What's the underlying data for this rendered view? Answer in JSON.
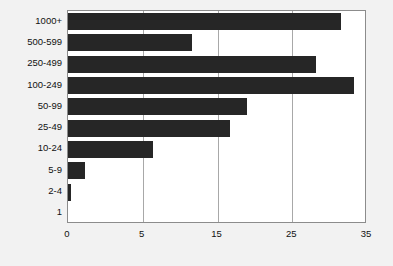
{
  "chart_data": {
    "type": "bar",
    "orientation": "horizontal",
    "title": "",
    "subtitle": "",
    "xlabel": "",
    "ylabel": "",
    "categories": [
      "1000+",
      "500-599",
      "250-499",
      "100-249",
      "50-99",
      "25-49",
      "10-24",
      "5-9",
      "2-4",
      "1"
    ],
    "values": [
      32,
      14.5,
      29,
      33.5,
      21,
      19,
      10,
      2,
      0.4,
      0
    ],
    "series": [
      {
        "name": "",
        "values": [
          32,
          14.5,
          29,
          33.5,
          21,
          19,
          10,
          2,
          0.4,
          0
        ]
      }
    ],
    "xticks": [
      "0",
      "5",
      "15",
      "25",
      "35"
    ],
    "xtick_values": [
      0,
      5,
      15,
      25,
      35
    ],
    "xlim": [
      0,
      35
    ],
    "ylim": null,
    "grid": "vertical",
    "legend": "none",
    "bar_color": "#262626",
    "plot_background": "#ffffff",
    "page_background": "#f2f2f2",
    "frame_color": "#8c8c8c",
    "gridline_color": "#a8a8a8",
    "annotations": []
  },
  "axes": {
    "x_tick_labels": [
      {
        "text": "0",
        "pos_pct": 0
      },
      {
        "text": "5",
        "pos_pct": 25
      },
      {
        "text": "15",
        "pos_pct": 50
      },
      {
        "text": "25",
        "pos_pct": 75
      },
      {
        "text": "35",
        "pos_pct": 100
      }
    ],
    "y_tick_labels": [
      {
        "text": "1000+"
      },
      {
        "text": "500-599"
      },
      {
        "text": "250-499"
      },
      {
        "text": "100-249"
      },
      {
        "text": "50-99"
      },
      {
        "text": "25-49"
      },
      {
        "text": "10-24"
      },
      {
        "text": "5-9"
      },
      {
        "text": "2-4"
      },
      {
        "text": "1"
      }
    ]
  }
}
